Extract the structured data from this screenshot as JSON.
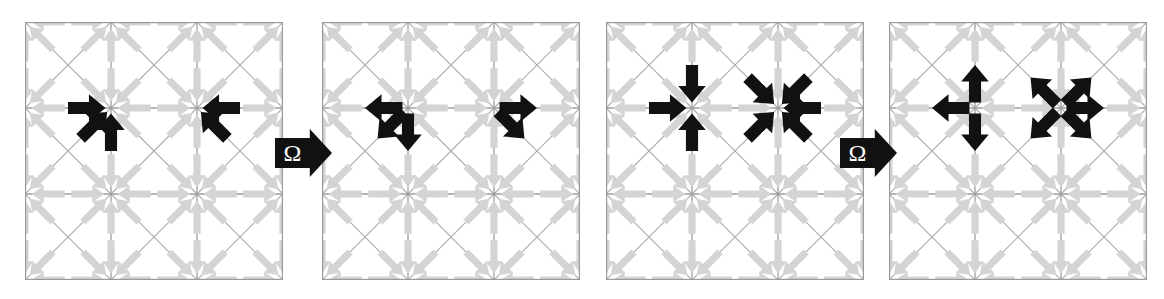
{
  "figure": {
    "title": "",
    "background_color": "#ffffff",
    "lattice_color": "#9a9a9a",
    "ghost_arrow_color": "#d4d4d4",
    "active_arrow_color": "#111111",
    "operator_symbol": "Ω"
  },
  "lattice": {
    "cols": 3,
    "rows": 3,
    "cell_px": 78,
    "node_arrow_length": 30,
    "directions": [
      "N",
      "NE",
      "E",
      "SE",
      "S",
      "SW",
      "W",
      "NW"
    ],
    "gridlines": [
      "horizontal",
      "vertical",
      "diagonal-down",
      "diagonal-up"
    ]
  },
  "panels": [
    {
      "id": "panel-1",
      "index": 1,
      "label": "before-left",
      "x": 25,
      "y": 22,
      "size": 258,
      "active_arrows": [
        {
          "node": [
            1,
            0
          ],
          "dir": "SE",
          "mode": "in",
          "side": "NW"
        },
        {
          "node": [
            1,
            0
          ],
          "dir": "S",
          "mode": "in",
          "side": "N"
        },
        {
          "node": [
            2,
            0
          ],
          "dir": "SW",
          "mode": "in",
          "side": "NE"
        },
        {
          "node": [
            1,
            1
          ],
          "dir": "E",
          "mode": "in",
          "side": "W"
        },
        {
          "node": [
            1,
            1
          ],
          "dir": "N",
          "mode": "in",
          "side": "S"
        },
        {
          "node": [
            1,
            1
          ],
          "dir": "NE",
          "mode": "in",
          "side": "SW"
        },
        {
          "node": [
            2,
            1
          ],
          "dir": "W",
          "mode": "in",
          "side": "E"
        },
        {
          "node": [
            2,
            1
          ],
          "dir": "NW",
          "mode": "in",
          "side": "SE"
        }
      ]
    },
    {
      "id": "panel-2",
      "index": 2,
      "label": "after-left",
      "x": 322,
      "y": 22,
      "size": 258,
      "active_arrows": [
        {
          "node": [
            1,
            0
          ],
          "dir": "NW",
          "mode": "out",
          "side": "NW"
        },
        {
          "node": [
            1,
            0
          ],
          "dir": "N",
          "mode": "out",
          "side": "N"
        },
        {
          "node": [
            2,
            0
          ],
          "dir": "NE",
          "mode": "out",
          "side": "NE"
        },
        {
          "node": [
            1,
            1
          ],
          "dir": "W",
          "mode": "out",
          "side": "W"
        },
        {
          "node": [
            1,
            1
          ],
          "dir": "S",
          "mode": "out",
          "side": "S"
        },
        {
          "node": [
            1,
            1
          ],
          "dir": "SW",
          "mode": "out",
          "side": "SW"
        },
        {
          "node": [
            2,
            1
          ],
          "dir": "E",
          "mode": "out",
          "side": "E"
        },
        {
          "node": [
            2,
            1
          ],
          "dir": "SE",
          "mode": "out",
          "side": "SE"
        }
      ]
    },
    {
      "id": "panel-3",
      "index": 3,
      "label": "before-right",
      "x": 606,
      "y": 22,
      "size": 258,
      "active_arrows": [
        {
          "node": [
            1,
            1
          ],
          "dir": "S",
          "mode": "in",
          "side": "N"
        },
        {
          "node": [
            1,
            1
          ],
          "dir": "N",
          "mode": "in",
          "side": "S"
        },
        {
          "node": [
            1,
            1
          ],
          "dir": "E",
          "mode": "in",
          "side": "W"
        },
        {
          "node": [
            2,
            1
          ],
          "dir": "SW",
          "mode": "in",
          "side": "NE"
        },
        {
          "node": [
            2,
            1
          ],
          "dir": "SE",
          "mode": "in",
          "side": "NW"
        },
        {
          "node": [
            2,
            1
          ],
          "dir": "NW",
          "mode": "in",
          "side": "SE"
        },
        {
          "node": [
            2,
            1
          ],
          "dir": "NE",
          "mode": "in",
          "side": "SW"
        },
        {
          "node": [
            2,
            1
          ],
          "dir": "W",
          "mode": "in",
          "side": "E"
        }
      ]
    },
    {
      "id": "panel-4",
      "index": 4,
      "label": "after-right",
      "x": 889,
      "y": 22,
      "size": 258,
      "active_arrows": [
        {
          "node": [
            1,
            1
          ],
          "dir": "N",
          "mode": "out",
          "side": "N"
        },
        {
          "node": [
            1,
            1
          ],
          "dir": "S",
          "mode": "out",
          "side": "S"
        },
        {
          "node": [
            1,
            1
          ],
          "dir": "W",
          "mode": "out",
          "side": "W"
        },
        {
          "node": [
            2,
            1
          ],
          "dir": "NE",
          "mode": "out",
          "side": "NE"
        },
        {
          "node": [
            2,
            1
          ],
          "dir": "NW",
          "mode": "out",
          "side": "NW"
        },
        {
          "node": [
            2,
            1
          ],
          "dir": "SE",
          "mode": "out",
          "side": "SE"
        },
        {
          "node": [
            2,
            1
          ],
          "dir": "SW",
          "mode": "out",
          "side": "SW"
        },
        {
          "node": [
            2,
            1
          ],
          "dir": "E",
          "mode": "out",
          "side": "E"
        }
      ]
    }
  ],
  "operators": [
    {
      "id": "operator-1",
      "symbol": "Ω",
      "x": 275,
      "y": 127,
      "w": 58,
      "h": 52,
      "direction": "right"
    },
    {
      "id": "operator-2",
      "symbol": "Ω",
      "x": 840,
      "y": 127,
      "w": 58,
      "h": 52,
      "direction": "right"
    }
  ]
}
